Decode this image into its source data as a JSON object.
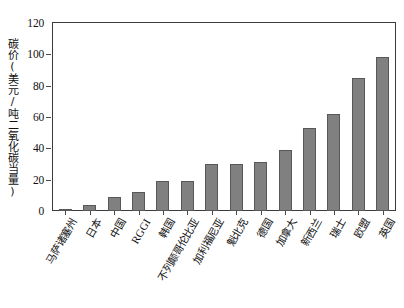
{
  "chart_data": {
    "type": "bar",
    "title": "",
    "subtitle": "",
    "xlabel": "",
    "ylabel": "碳价(美元/吨二氧化碳当量)",
    "ylim": [
      0,
      120
    ],
    "ytick_values": [
      0,
      20,
      40,
      60,
      80,
      100,
      120
    ],
    "ytick_labels": [
      "0",
      "20",
      "40",
      "60",
      "80",
      "100",
      "120"
    ],
    "grid": false,
    "legend": null,
    "bar_color": "#808080",
    "bar_edge_color": "#585858",
    "axis_color": "#3b3b3b",
    "categories": [
      "马萨诸塞州",
      "日本",
      "中国",
      "RGGI",
      "韩国",
      "不列颠哥伦比亚",
      "加利福尼亚",
      "魁北克",
      "德国",
      "加拿大",
      "新西兰",
      "瑞士",
      "欧盟",
      "英国"
    ],
    "values": [
      1,
      4,
      9,
      12,
      19,
      19,
      30,
      30,
      31,
      39,
      53,
      62,
      85,
      98
    ]
  }
}
